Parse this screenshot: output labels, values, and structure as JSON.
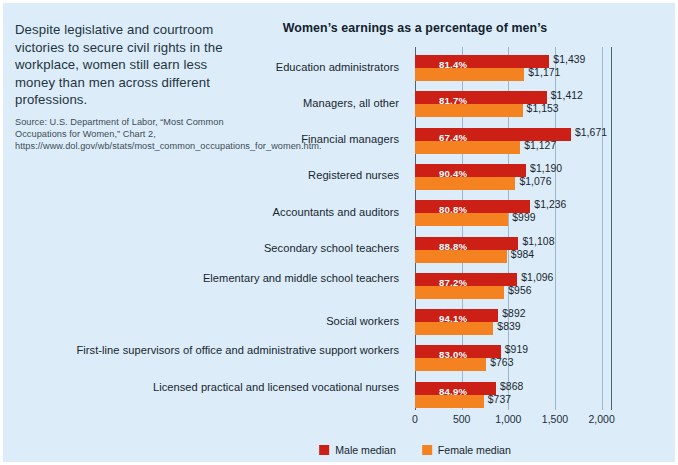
{
  "caption": {
    "lead": "Despite legislative and courtroom victories to secure civil rights in the workplace, women still earn less money than men across different professions.",
    "source": "Source: U.S. Department of Labor, “Most Common Occupations for Women,” Chart 2, https://www.dol.gov/wb/stats/most_common_occupations_for_women.htm."
  },
  "legend": {
    "male_label": "Male median",
    "female_label": "Female median",
    "male_color": "#cc2017",
    "female_color": "#f58220"
  },
  "colors": {
    "background": "#dcecf8",
    "male": "#cc2017",
    "female": "#f58220",
    "gridline": "#9bb7c9",
    "axis": "#4d6473",
    "text": "#16262f"
  },
  "chart_data": {
    "type": "bar",
    "orientation": "horizontal",
    "title": "Women’s earnings as a percentage of men’s",
    "xlabel": "",
    "ylabel": "",
    "xlim": [
      0,
      2100
    ],
    "grid": true,
    "legend_position": "bottom",
    "xticks": [
      0,
      500,
      1000,
      1500,
      2000
    ],
    "xtick_labels": [
      "0",
      "500",
      "1,000",
      "1,500",
      "2,000"
    ],
    "categories": [
      "Education administrators",
      "Managers, all other",
      "Financial managers",
      "Registered nurses",
      "Accountants and auditors",
      "Secondary school teachers",
      "Elementary and\nmiddle school teachers",
      "Social workers",
      "First-line supervisors of office and\nadministrative support workers",
      "Licensed practical and\nlicensed vocational nurses"
    ],
    "series": [
      {
        "name": "Male median",
        "color": "#cc2017",
        "values": [
          1439,
          1412,
          1671,
          1190,
          1236,
          1108,
          1096,
          892,
          919,
          868
        ],
        "labels": [
          "$1,439",
          "$1,412",
          "$1,671",
          "$1,190",
          "$1,236",
          "$1,108",
          "$1,096",
          "$892",
          "$919",
          "$868"
        ]
      },
      {
        "name": "Female median",
        "color": "#f58220",
        "values": [
          1171,
          1153,
          1127,
          1076,
          999,
          984,
          956,
          839,
          763,
          737
        ],
        "labels": [
          "$1,171",
          "$1,153",
          "$1,127",
          "$1,076",
          "$999",
          "$984",
          "$956",
          "$839",
          "$763",
          "$737"
        ]
      }
    ],
    "ratio_labels": [
      "81.4%",
      "81.7%",
      "67.4%",
      "90.4%",
      "80.8%",
      "88.8%",
      "87.2%",
      "94.1%",
      "83.0%",
      "84.9%"
    ]
  }
}
